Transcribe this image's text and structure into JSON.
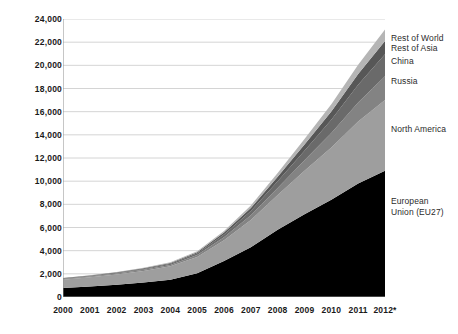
{
  "chart_data": {
    "type": "area",
    "stacked": true,
    "title": "",
    "xlabel": "",
    "ylabel": "",
    "categories": [
      "2000",
      "2001",
      "2002",
      "2003",
      "2004",
      "2005",
      "2006",
      "2007",
      "2008",
      "2009",
      "2010",
      "2011",
      "2012*"
    ],
    "ylim": [
      0,
      24000
    ],
    "ytick_step": 2000,
    "yticks": [
      "0",
      "2,000",
      "4,000",
      "6,000",
      "8,000",
      "10,000",
      "12,000",
      "14,000",
      "16,000",
      "18,000",
      "20,000",
      "22,000",
      "24,000"
    ],
    "grid": true,
    "grid_axis": "y",
    "legend": "right-inline-labels",
    "series": [
      {
        "name": "European Union (EU27)",
        "color": "#000000",
        "values": [
          780,
          900,
          1050,
          1250,
          1500,
          2050,
          3100,
          4300,
          5800,
          7150,
          8400,
          9800,
          10900
        ]
      },
      {
        "name": "North America",
        "color": "#9e9e9e",
        "values": [
          720,
          800,
          900,
          1000,
          1150,
          1400,
          1800,
          2350,
          3000,
          3750,
          4500,
          5350,
          6100
        ]
      },
      {
        "name": "Russia",
        "color": "#838383",
        "values": [
          60,
          70,
          80,
          95,
          120,
          170,
          260,
          400,
          620,
          900,
          1250,
          1650,
          2050
        ]
      },
      {
        "name": "China",
        "color": "#6a6a6a",
        "values": [
          40,
          50,
          60,
          75,
          100,
          150,
          240,
          380,
          580,
          830,
          1150,
          1520,
          1900
        ]
      },
      {
        "name": "Rest of Asia",
        "color": "#575757",
        "values": [
          30,
          35,
          45,
          55,
          70,
          100,
          160,
          250,
          380,
          540,
          720,
          930,
          1150
        ]
      },
      {
        "name": "Rest of World",
        "color": "#b5b5b5",
        "values": [
          20,
          25,
          30,
          40,
          55,
          80,
          130,
          210,
          320,
          460,
          620,
          800,
          1000
        ]
      }
    ],
    "series_label_positions": [
      {
        "name": "Rest of World",
        "text": "Rest of World",
        "top": 33,
        "left": 391
      },
      {
        "name": "Rest of Asia",
        "text": "Rest of Asia",
        "top": 43,
        "left": 391
      },
      {
        "name": "China",
        "text": "China",
        "top": 56,
        "left": 391
      },
      {
        "name": "Russia",
        "text": "Russia",
        "top": 76,
        "left": 391
      },
      {
        "name": "North America",
        "text": "North America",
        "top": 124,
        "left": 391
      },
      {
        "name": "European Union",
        "text": "European\nUnion (EU27)",
        "top": 196,
        "left": 391
      }
    ],
    "colors": {
      "gridline": "#c9c9c9",
      "axis": "#8d8d8d",
      "background": "#ffffff",
      "tick_text": "#1a1a1a"
    }
  }
}
